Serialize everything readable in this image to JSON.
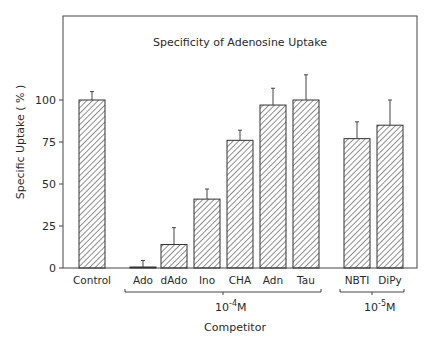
{
  "chart_data": {
    "type": "bar",
    "title": "Specificity of Adenosine Uptake",
    "xlabel": "Competitor",
    "ylabel": "Specific Uptake ( % )",
    "ylim": [
      0,
      100
    ],
    "yticks": [
      0,
      25,
      50,
      75,
      100
    ],
    "grid": false,
    "legend": null,
    "categories": [
      "Control",
      "Ado",
      "dAdo",
      "Ino",
      "CHA",
      "Adn",
      "Tau",
      "NBTI",
      "DiPy"
    ],
    "values": [
      100,
      0.5,
      14,
      41,
      76,
      97,
      100,
      77,
      85
    ],
    "error": [
      5,
      4,
      10,
      6,
      6,
      10,
      15,
      10,
      15
    ],
    "groups": [
      {
        "label": "10-4M",
        "base": "10",
        "exponent": "-4",
        "unit": "M",
        "members": [
          "Ado",
          "dAdo",
          "Ino",
          "CHA",
          "Adn",
          "Tau"
        ]
      },
      {
        "label": "10-5M",
        "base": "10",
        "exponent": "-5",
        "unit": "M",
        "members": [
          "NBTI",
          "DiPy"
        ]
      }
    ],
    "bar_style": "diagonal hatch, black outline"
  }
}
